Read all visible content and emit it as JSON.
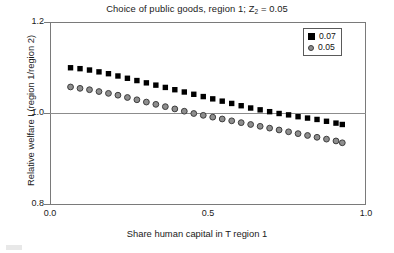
{
  "chart_data": {
    "type": "scatter",
    "title": "Choice of public goods, region 1; Z2 = 0.05",
    "title_main": "Choice of public goods, region 1; Z",
    "title_sub": "2",
    "title_tail": " = 0.05",
    "xlabel": "Share human capital in T region 1",
    "ylabel": "Relative welfare I (region 1/region 2)",
    "xlim": [
      0.0,
      1.0
    ],
    "ylim": [
      0.8,
      1.2
    ],
    "xticks": [
      0.0,
      0.5,
      1.0
    ],
    "xtick_labels": [
      "0.0",
      "0.5",
      "1.0"
    ],
    "yticks": [
      0.8,
      1.0,
      1.2
    ],
    "ytick_labels": [
      "0.8",
      "1.0",
      "1.2"
    ],
    "grid": false,
    "reference_lines": [
      {
        "axis": "y",
        "value": 1.0,
        "color": "#8c8c8c"
      }
    ],
    "legend_position": "top-right",
    "x": [
      0.065,
      0.095,
      0.125,
      0.155,
      0.185,
      0.215,
      0.245,
      0.275,
      0.305,
      0.335,
      0.365,
      0.395,
      0.425,
      0.455,
      0.485,
      0.515,
      0.545,
      0.575,
      0.605,
      0.635,
      0.665,
      0.695,
      0.725,
      0.755,
      0.785,
      0.815,
      0.845,
      0.875,
      0.905,
      0.925
    ],
    "series": [
      {
        "name": "0.07",
        "marker": "square",
        "color": "#000000",
        "values": [
          1.1,
          1.098,
          1.095,
          1.091,
          1.087,
          1.082,
          1.077,
          1.072,
          1.067,
          1.062,
          1.057,
          1.052,
          1.047,
          1.042,
          1.037,
          1.032,
          1.027,
          1.022,
          1.017,
          1.012,
          1.008,
          1.004,
          1.0,
          0.997,
          0.993,
          0.99,
          0.987,
          0.983,
          0.979,
          0.976
        ]
      },
      {
        "name": "0.05",
        "marker": "circle",
        "color": "#8e8e8e",
        "edge_color": "#3d3d3d",
        "values": [
          1.058,
          1.055,
          1.052,
          1.048,
          1.044,
          1.04,
          1.035,
          1.03,
          1.025,
          1.02,
          1.015,
          1.01,
          1.005,
          1.0,
          0.996,
          0.992,
          0.988,
          0.984,
          0.98,
          0.976,
          0.972,
          0.968,
          0.964,
          0.96,
          0.956,
          0.952,
          0.948,
          0.944,
          0.94,
          0.936
        ]
      }
    ]
  },
  "legend": {
    "items": [
      {
        "label": "0.07",
        "marker": "square"
      },
      {
        "label": "0.05",
        "marker": "circle"
      }
    ]
  },
  "colors": {
    "series_07": "#000000",
    "series_05": "#8e8e8e",
    "frame": "#7a7a7a",
    "reference_line": "#8c8c8c",
    "text": "#1a1a1a",
    "background": "#ffffff"
  }
}
